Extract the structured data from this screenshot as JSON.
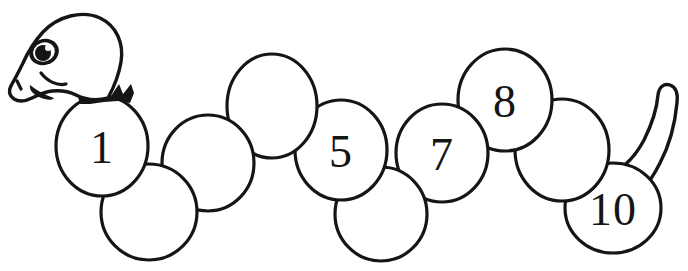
{
  "worksheet": {
    "title": "Counting Caterpillar",
    "subject": "caterpillar-line-art",
    "style": "black-and-white coloring page line art",
    "background_color": "#ffffff",
    "ink_color": "#151515",
    "canvas": {
      "width": 688,
      "height": 271
    }
  },
  "creature": {
    "name": "caterpillar",
    "head": {
      "label": "head",
      "facing": "left",
      "features": [
        "eye",
        "eye-highlight",
        "smiling-mouth",
        "nostril",
        "spiky-collar"
      ]
    },
    "tail": {
      "label": "tail",
      "shape": "curved-tapered-hook",
      "direction": "up-right"
    },
    "segment_count": 10
  },
  "segments": [
    {
      "index": 1,
      "number": "1",
      "filled": true,
      "cx": 102,
      "cy": 146,
      "r": 45
    },
    {
      "index": 2,
      "number": "",
      "filled": false,
      "cx": 149,
      "cy": 212,
      "r": 45
    },
    {
      "index": 3,
      "number": "",
      "filled": false,
      "cx": 208,
      "cy": 163,
      "r": 45
    },
    {
      "index": 4,
      "number": "",
      "filled": false,
      "cx": 272,
      "cy": 106,
      "r": 45
    },
    {
      "index": 5,
      "number": "5",
      "filled": true,
      "cx": 341,
      "cy": 150,
      "r": 45
    },
    {
      "index": 6,
      "number": "",
      "filled": false,
      "cx": 381,
      "cy": 214,
      "r": 45
    },
    {
      "index": 7,
      "number": "7",
      "filled": true,
      "cx": 442,
      "cy": 153,
      "r": 45
    },
    {
      "index": 8,
      "number": "8",
      "filled": true,
      "cx": 505,
      "cy": 100,
      "r": 45
    },
    {
      "index": 9,
      "number": "",
      "filled": false,
      "cx": 562,
      "cy": 150,
      "r": 45
    },
    {
      "index": 10,
      "number": "10",
      "filled": true,
      "cx": 613,
      "cy": 208,
      "r": 45
    }
  ],
  "numbers_shown": [
    "1",
    "5",
    "7",
    "8",
    "10"
  ],
  "numbers_blank_count": 5
}
